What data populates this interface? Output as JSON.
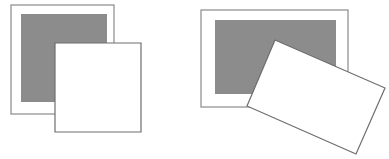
{
  "colors": {
    "background": "#ffffff",
    "frame_stroke": "#8a8a8a",
    "gray_fill": "#8c8c8c",
    "card_fill": "#ffffff",
    "card_stroke": "#6e6e6e"
  },
  "figures": [
    {
      "name": "aligned-overlap",
      "frame": {
        "x": 11,
        "y": 5,
        "w": 103,
        "h": 109
      },
      "gray": {
        "x": 21,
        "y": 14,
        "w": 86,
        "h": 88
      },
      "card": {
        "points": "55,43 141,43 141,132 55,132"
      }
    },
    {
      "name": "rotated-overlap",
      "frame": {
        "x": 201,
        "y": 10,
        "w": 147,
        "h": 97
      },
      "gray": {
        "x": 215,
        "y": 20,
        "w": 121,
        "h": 74
      },
      "card": {
        "points": "275,40 385,88 356,154 247,106"
      }
    }
  ]
}
